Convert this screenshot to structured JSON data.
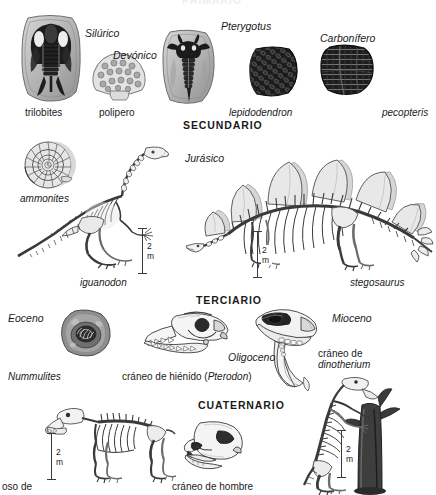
{
  "figure": {
    "title_cut_top": "PRIMARIO",
    "background_color": "#ffffff",
    "ink_color": "#1a1a1a"
  },
  "eras": [
    {
      "id": "primario",
      "label": "PRIMARIO",
      "cut_off": true
    },
    {
      "id": "secundario",
      "label": "SECUNDARIO",
      "cut_off": false
    },
    {
      "id": "terciario",
      "label": "TERCIARIO",
      "cut_off": false
    },
    {
      "id": "cuaternario",
      "label": "CUATERNARIO",
      "cut_off": false
    }
  ],
  "periods": [
    {
      "id": "silurico",
      "label": "Silúrico"
    },
    {
      "id": "devonico",
      "label": "Devónico"
    },
    {
      "id": "carbonifero",
      "label": "Carbonífero"
    },
    {
      "id": "jurasico",
      "label": "Jurásico"
    },
    {
      "id": "eoceno",
      "label": "Eoceno"
    },
    {
      "id": "oligoceno",
      "label": "Oligoceno"
    },
    {
      "id": "mioceno",
      "label": "Mioceno"
    }
  ],
  "specimens": {
    "pterygotus": "Pterygotus",
    "trilobites": "trilobites",
    "polipero": "polipero",
    "lepidodendron": "lepidodendron",
    "pecopteris": "pecopteris",
    "ammonites": "ammonites",
    "iguanodon": "iguanodon",
    "stegosaurus": "stegosaurus",
    "nummulites": "Nummulites",
    "hienido_pre": "cráneo de hiénido (",
    "hienido_genus": "Pterodon",
    "hienido_post": ")",
    "dinotherium_line1": "cráneo de",
    "dinotherium_line2": "dinotherium",
    "oso_de": "oso de",
    "craneo_hombre": "cráneo de hombre"
  },
  "scale_bars": [
    {
      "id": "iguanodon-scale",
      "label": "2 m"
    },
    {
      "id": "stegosaurus-scale",
      "label": "2 m"
    },
    {
      "id": "oso-scale",
      "label": "2 m"
    },
    {
      "id": "megaterio-scale",
      "label": "2 m"
    }
  ]
}
